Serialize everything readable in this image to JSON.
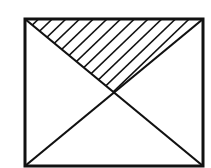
{
  "diagram": {
    "stroke_color": "#111111",
    "background_color": "#ffffff",
    "rectangle": {
      "x1": 25,
      "y1": 19,
      "x2": 203,
      "y2": 166
    },
    "diagonals": [
      {
        "name": "top-left-to-bottom-right",
        "from": [
          25,
          19
        ],
        "to": [
          203,
          166
        ]
      },
      {
        "name": "top-right-to-bottom-left",
        "from": [
          203,
          19
        ],
        "to": [
          25,
          166
        ]
      }
    ],
    "intersection": [
      114,
      92
    ],
    "shaded_region": {
      "shape": "triangle",
      "vertices": [
        [
          25,
          19
        ],
        [
          203,
          19
        ],
        [
          114,
          92
        ]
      ],
      "fill": "diagonal-hatching",
      "hatch_line_count": 13
    }
  }
}
